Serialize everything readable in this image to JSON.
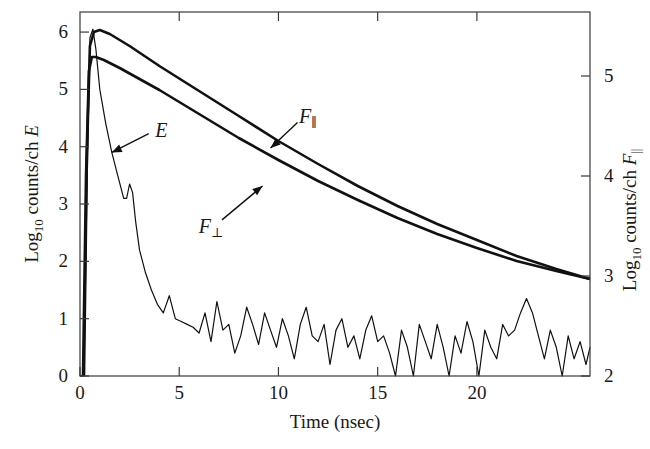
{
  "chart_data": {
    "type": "line",
    "title": "",
    "xlabel": "Time (nsec)",
    "ylabel_left": "Log10 counts/ch E",
    "ylabel_right": "Log10 counts/ch F∥",
    "xlim": [
      0,
      25.7
    ],
    "ylim_left": [
      0,
      6.35
    ],
    "ylim_right": [
      2,
      5.64
    ],
    "x_ticks": [
      0,
      5,
      10,
      15,
      20
    ],
    "y_ticks_left": [
      0,
      1,
      2,
      3,
      4,
      5,
      6
    ],
    "y_ticks_right": [
      2,
      3,
      4,
      5
    ],
    "grid": false,
    "legend": "none (inline curve labels)",
    "annotations": [
      {
        "text": "E",
        "target_series": "E",
        "label_xy": [
          4.1,
          4.3
        ],
        "arrow_to": [
          1.6,
          3.9
        ]
      },
      {
        "text": "F⊥",
        "target_series": "F_perp",
        "label_xy": [
          6.6,
          3.5
        ],
        "arrow_to": [
          9.2,
          3.9
        ]
      },
      {
        "text": "F∥",
        "target_series": "F_par",
        "label_xy": [
          11.5,
          4.6
        ],
        "arrow_to": [
          9.6,
          4.28
        ]
      }
    ],
    "series": [
      {
        "name": "E",
        "label": "E",
        "axis": "left",
        "style": "noisy",
        "x": [
          0.0,
          0.2,
          0.35,
          0.5,
          0.65,
          0.8,
          1.0,
          1.3,
          1.6,
          1.9,
          2.2,
          2.35,
          2.5,
          2.65,
          2.8,
          3.0,
          3.3,
          3.6,
          3.9,
          4.2,
          4.5,
          4.8,
          5.1,
          5.4,
          5.7,
          6.0,
          6.3,
          6.6,
          6.9,
          7.2,
          7.5,
          7.8,
          8.1,
          8.4,
          8.7,
          9.0,
          9.3,
          9.6,
          9.9,
          10.2,
          10.5,
          10.8,
          11.1,
          11.4,
          11.7,
          12.0,
          12.3,
          12.6,
          12.9,
          13.2,
          13.5,
          13.8,
          14.1,
          14.4,
          14.7,
          15.0,
          15.3,
          15.6,
          15.9,
          16.2,
          16.5,
          16.8,
          17.1,
          17.4,
          17.7,
          18.0,
          18.3,
          18.6,
          18.9,
          19.2,
          19.5,
          19.8,
          20.1,
          20.4,
          20.7,
          21.0,
          21.3,
          21.6,
          21.9,
          22.2,
          22.5,
          22.8,
          23.1,
          23.4,
          23.7,
          24.0,
          24.3,
          24.6,
          24.9,
          25.2,
          25.5,
          25.7
        ],
        "y": [
          0.0,
          0.0,
          3.2,
          5.9,
          6.05,
          5.7,
          5.0,
          4.4,
          3.9,
          3.5,
          3.1,
          3.1,
          3.35,
          3.2,
          2.7,
          2.2,
          1.8,
          1.5,
          1.25,
          1.1,
          1.4,
          1.0,
          0.95,
          0.9,
          0.85,
          0.75,
          1.1,
          0.6,
          1.3,
          0.8,
          0.9,
          0.4,
          0.7,
          1.2,
          0.9,
          0.55,
          1.1,
          0.8,
          0.5,
          1.0,
          0.7,
          0.3,
          0.9,
          1.2,
          0.7,
          0.6,
          0.9,
          0.2,
          0.8,
          1.0,
          0.5,
          0.7,
          0.3,
          0.8,
          1.05,
          0.6,
          0.7,
          0.4,
          0.0,
          0.8,
          0.5,
          0.0,
          0.9,
          0.6,
          0.3,
          0.9,
          0.5,
          0.0,
          0.7,
          0.4,
          0.95,
          0.6,
          0.0,
          0.8,
          0.5,
          0.3,
          0.9,
          0.7,
          0.8,
          1.1,
          1.35,
          1.1,
          0.7,
          0.3,
          0.8,
          0.5,
          0.0,
          0.7,
          0.3,
          0.6,
          0.2,
          0.5
        ]
      },
      {
        "name": "F_par",
        "label": "F∥",
        "axis": "right",
        "style": "smooth",
        "x": [
          0.2,
          0.35,
          0.5,
          0.7,
          1.0,
          1.5,
          2.5,
          4.0,
          6.0,
          8.0,
          10.0,
          12.0,
          14.0,
          16.0,
          18.0,
          20.0,
          22.0,
          24.0,
          25.7
        ],
        "y": [
          2.0,
          4.2,
          5.3,
          5.44,
          5.46,
          5.42,
          5.3,
          5.1,
          4.85,
          4.6,
          4.35,
          4.12,
          3.9,
          3.7,
          3.52,
          3.36,
          3.2,
          3.07,
          2.97
        ]
      },
      {
        "name": "F_perp",
        "label": "F⊥",
        "axis": "right",
        "style": "smooth",
        "x": [
          0.15,
          0.3,
          0.45,
          0.6,
          0.8,
          1.2,
          2.0,
          4.0,
          6.0,
          8.0,
          10.0,
          12.0,
          14.0,
          16.0,
          18.0,
          20.0,
          22.0,
          24.0,
          25.7
        ],
        "y": [
          2.0,
          4.0,
          5.05,
          5.19,
          5.19,
          5.16,
          5.08,
          4.86,
          4.62,
          4.38,
          4.16,
          3.95,
          3.76,
          3.58,
          3.42,
          3.28,
          3.15,
          3.05,
          2.97
        ]
      }
    ]
  },
  "axes": {
    "x_title": "Time (nsec)",
    "left_title_main": "Log",
    "left_title_sub": "10",
    "left_title_rest": " counts/ch ",
    "left_title_var": "E",
    "right_title_main": "Log",
    "right_title_sub": "10",
    "right_title_rest": " counts/ch ",
    "right_title_var": "F",
    "right_title_var_sub": "||"
  }
}
